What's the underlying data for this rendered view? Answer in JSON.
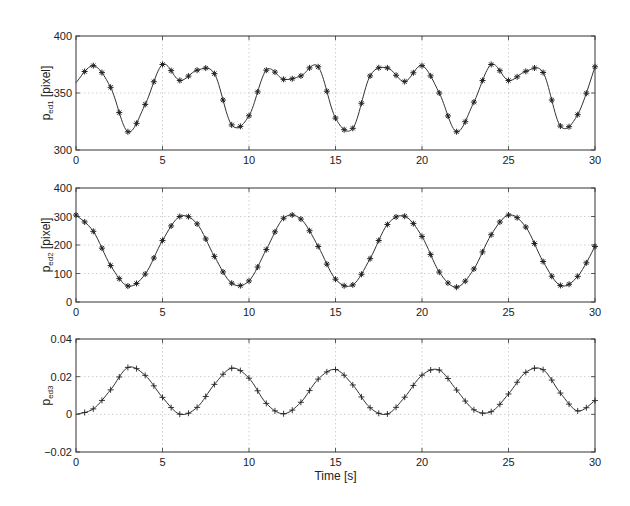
{
  "chart_data": [
    {
      "type": "line",
      "ylabel": "p_ed1 [pixel]",
      "ylabel_main": "p",
      "ylabel_sub": "ed1",
      "ylabel_unit": " [pixel]",
      "xlim": [
        0,
        30
      ],
      "ylim": [
        300,
        400
      ],
      "xticks": [
        0,
        5,
        10,
        15,
        20,
        25,
        30
      ],
      "yticks": [
        300,
        350,
        400
      ],
      "grid_y": [
        350
      ],
      "marker": "asterisk",
      "x": [
        0,
        1,
        2,
        3,
        4,
        5,
        6,
        7,
        8,
        9,
        10,
        11,
        12,
        13,
        14,
        15,
        16,
        17,
        18,
        19,
        20,
        21,
        22,
        23,
        24,
        25,
        26,
        27,
        28,
        29,
        30
      ],
      "values": [
        359,
        374,
        355,
        316,
        340,
        375,
        361,
        370,
        367,
        322,
        330,
        370,
        362,
        365,
        373,
        328,
        319,
        365,
        372,
        360,
        374,
        350,
        316,
        342,
        375,
        361,
        369,
        368,
        321,
        331,
        373
      ]
    },
    {
      "type": "line",
      "ylabel": "p_ed2 [pixel]",
      "ylabel_main": "p",
      "ylabel_sub": "ed2",
      "ylabel_unit": " [pixel]",
      "xlim": [
        0,
        30
      ],
      "ylim": [
        0,
        400
      ],
      "xticks": [
        0,
        5,
        10,
        15,
        20,
        25,
        30
      ],
      "yticks": [
        0,
        100,
        200,
        300,
        400
      ],
      "grid_y": [
        100,
        200,
        300
      ],
      "marker": "asterisk",
      "x": [
        0,
        1,
        2,
        3,
        4,
        5,
        6,
        7,
        8,
        9,
        10,
        11,
        12,
        13,
        14,
        15,
        16,
        17,
        18,
        19,
        20,
        21,
        22,
        23,
        24,
        25,
        26,
        27,
        28,
        29,
        30
      ],
      "values": [
        305,
        248,
        128,
        56,
        98,
        216,
        300,
        274,
        160,
        66,
        74,
        184,
        294,
        291,
        195,
        80,
        60,
        152,
        272,
        301,
        230,
        105,
        52,
        116,
        236,
        305,
        263,
        142,
        58,
        90,
        195
      ]
    },
    {
      "type": "line",
      "ylabel": "p_ed3",
      "ylabel_main": "p",
      "ylabel_sub": "ed3",
      "ylabel_unit": "",
      "xlabel": "Time [s]",
      "xlim": [
        0,
        30
      ],
      "ylim": [
        -0.02,
        0.04
      ],
      "xticks": [
        0,
        5,
        10,
        15,
        20,
        25,
        30
      ],
      "yticks": [
        -0.02,
        0,
        0.02,
        0.04
      ],
      "ytick_labels": [
        "−0.02",
        "0",
        "0.02",
        "0.04"
      ],
      "grid_y": [
        0,
        0.02
      ],
      "marker": "plus",
      "x": [
        0,
        1,
        2,
        3,
        4,
        5,
        6,
        7,
        8,
        9,
        10,
        11,
        12,
        13,
        14,
        15,
        16,
        17,
        18,
        19,
        20,
        21,
        22,
        23,
        24,
        25,
        26,
        27,
        28,
        29,
        30
      ],
      "values": [
        0,
        0.0029,
        0.013,
        0.0249,
        0.0207,
        0.009,
        0.0001,
        0.0037,
        0.0159,
        0.0245,
        0.0192,
        0.0058,
        0.0003,
        0.0064,
        0.0187,
        0.0238,
        0.0156,
        0.0035,
        0.0002,
        0.0091,
        0.0208,
        0.0235,
        0.0129,
        0.0024,
        0.0014,
        0.0108,
        0.0223,
        0.0237,
        0.0113,
        0.0018,
        0.0073
      ]
    }
  ],
  "axes": {
    "xlabel": "Time [s]"
  }
}
